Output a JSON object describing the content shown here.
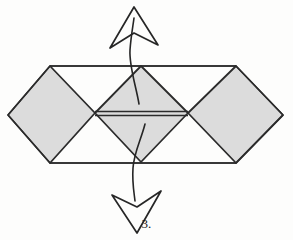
{
  "figure": {
    "caption": "3.",
    "background_color": "#fdfdfc",
    "facet_fill_color": "#dcdcdc",
    "line_color": "#2b2b2b",
    "arrow_color": "#262626",
    "shapes": {
      "left_diamond": {
        "name": "left-diamond-facet",
        "points": "8,115 50,66 95,113 50,163",
        "filled": true
      },
      "center_diamond": {
        "name": "center-diamond-facet",
        "points": "95,113 141,66 188,113 141,162",
        "filled": true
      },
      "right_diamond": {
        "name": "right-diamond-facet",
        "points": "188,113 236,66 283,115 236,163",
        "filled": true
      },
      "outer_outline": {
        "name": "outer-hexagon-outline",
        "points": "8,115 50,66 236,66 283,115 236,163 50,163",
        "filled": false
      },
      "top_edge": {
        "name": "top-edge-line",
        "x1": 50,
        "y1": 66,
        "x2": 236,
        "y2": 66
      },
      "bottom_edge": {
        "name": "bottom-edge-line",
        "x1": 50,
        "y1": 163,
        "x2": 236,
        "y2": 163
      },
      "center_seam_upper": {
        "name": "center-seam-upper-line",
        "x1": 95,
        "y1": 111,
        "x2": 188,
        "y2": 111
      },
      "center_seam_lower": {
        "name": "center-seam-lower-line",
        "x1": 95,
        "y1": 116,
        "x2": 188,
        "y2": 116
      }
    },
    "arrows": [
      {
        "name": "pull-up-arrow",
        "direction": "up",
        "tail_path": "M 139,104 C 136,86 129,66 130,50 C 131,36 133,26 134,18",
        "head_points": "134,8 157,44 134,34 111,47",
        "label": "pull up"
      },
      {
        "name": "pull-down-arrow",
        "direction": "down",
        "tail_path": "M 144,124 C 140,140 134,152 133,168 C 132,182 134,192 135,200",
        "head_points": "136,232 113,196 136,206 159,192",
        "label": "pull down"
      }
    ]
  }
}
